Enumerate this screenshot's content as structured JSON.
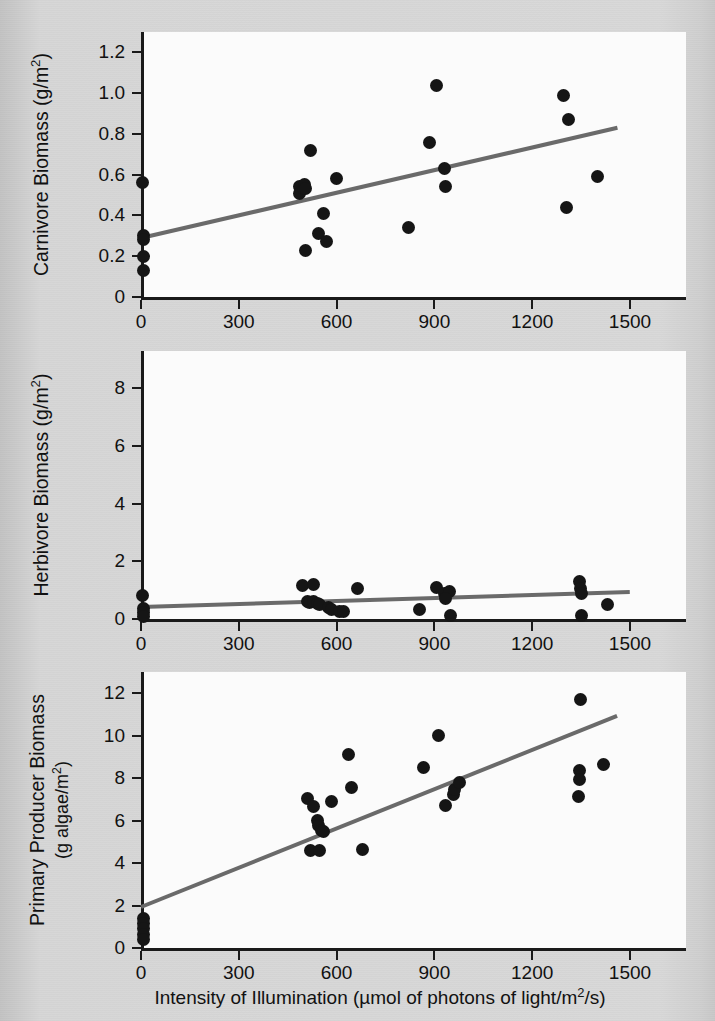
{
  "figure": {
    "x_axis_title": "Intensity of Illumination (µmol of photons of light/m²/s)",
    "x_ticks": [
      "0",
      "300",
      "600",
      "900",
      "1200",
      "1500"
    ],
    "dot_color": "#151515",
    "fit_line_color": "#6a6a6a",
    "panel_color": "#fbfbfb",
    "page_color": "#d6d6d6"
  },
  "ghost_text": [
    {
      "text": "DNA",
      "x": 404,
      "y": 84,
      "size": 23
    },
    {
      "text": "replication",
      "x": 372,
      "y": 112,
      "size": 23
    },
    {
      "text": "enzymes",
      "x": 378,
      "y": 140,
      "size": 23
    },
    {
      "text": "&",
      "x": 428,
      "y": 166,
      "size": 21
    },
    {
      "text": "proteins",
      "x": 380,
      "y": 192,
      "size": 23
    },
    {
      "text": "Key",
      "x": 216,
      "y": 430,
      "size": 17
    },
    {
      "text": "Sea Otters",
      "x": 172,
      "y": 462,
      "size": 17
    },
    {
      "text": "Sea Urchins",
      "x": 276,
      "y": 462,
      "size": 17
    },
    {
      "text": "Kelp",
      "x": 186,
      "y": 686,
      "size": 19
    },
    {
      "text": "A in the case of a kelp forest ecosystem,",
      "x": 170,
      "y": 712,
      "size": 17
    },
    {
      "text": "decreasing kelp biomass leads to reduced",
      "x": 170,
      "y": 740,
      "size": 17
    },
    {
      "text": "populations of sea urchins and a subsequent",
      "x": 170,
      "y": 768,
      "size": 17
    },
    {
      "text": "decrease in otters, a switch from the pyramid",
      "x": 170,
      "y": 796,
      "size": 17
    },
    {
      "text": "of biomass represented on the left.",
      "x": 170,
      "y": 824,
      "size": 17
    },
    {
      "text": "There are spaces, the population densities and",
      "x": 150,
      "y": 896,
      "size": 17
    },
    {
      "text": "the trophic levels cannot be sustained and survival",
      "x": 150,
      "y": 924,
      "size": 17
    }
  ],
  "chart_data": [
    {
      "type": "scatter",
      "id": "carnivore",
      "title": "",
      "xlabel": "Intensity of Illumination (µmol of photons of light/m²/s)",
      "ylabel": "Carnivore Biomass (g/m²)",
      "xlim": [
        0,
        1500
      ],
      "ylim": [
        0,
        1.3
      ],
      "xticks": [
        0,
        300,
        600,
        900,
        1200,
        1500
      ],
      "yticks": [
        0,
        0.2,
        0.4,
        0.6,
        0.8,
        1.0,
        1.2
      ],
      "ytick_labels": [
        "0",
        "0.2",
        "0.4",
        "0.6",
        "0.8",
        "1.0",
        "1.2"
      ],
      "grid": false,
      "legend": null,
      "points": [
        {
          "x": 5,
          "y": 0.56
        },
        {
          "x": 8,
          "y": 0.3
        },
        {
          "x": 8,
          "y": 0.28
        },
        {
          "x": 8,
          "y": 0.2
        },
        {
          "x": 8,
          "y": 0.13
        },
        {
          "x": 487,
          "y": 0.54
        },
        {
          "x": 487,
          "y": 0.51
        },
        {
          "x": 497,
          "y": 0.53
        },
        {
          "x": 500,
          "y": 0.55
        },
        {
          "x": 505,
          "y": 0.53
        },
        {
          "x": 505,
          "y": 0.23
        },
        {
          "x": 520,
          "y": 0.72
        },
        {
          "x": 545,
          "y": 0.31
        },
        {
          "x": 560,
          "y": 0.41
        },
        {
          "x": 570,
          "y": 0.27
        },
        {
          "x": 600,
          "y": 0.58
        },
        {
          "x": 820,
          "y": 0.34
        },
        {
          "x": 885,
          "y": 0.76
        },
        {
          "x": 905,
          "y": 1.04
        },
        {
          "x": 930,
          "y": 0.63
        },
        {
          "x": 935,
          "y": 0.54
        },
        {
          "x": 1295,
          "y": 0.99
        },
        {
          "x": 1310,
          "y": 0.87
        },
        {
          "x": 1305,
          "y": 0.44
        },
        {
          "x": 1400,
          "y": 0.59
        }
      ],
      "fit_line": {
        "x0": 0,
        "y0": 0.29,
        "x1": 1460,
        "y1": 0.83
      }
    },
    {
      "type": "scatter",
      "id": "herbivore",
      "title": "",
      "xlabel": "Intensity of Illumination (µmol of photons of light/m²/s)",
      "ylabel": "Herbivore Biomass (g/m²)",
      "xlim": [
        0,
        1500
      ],
      "ylim": [
        0,
        9.3
      ],
      "xticks": [
        0,
        300,
        600,
        900,
        1200,
        1500
      ],
      "yticks": [
        0,
        2,
        4,
        6,
        8
      ],
      "ytick_labels": [
        "0",
        "2",
        "4",
        "6",
        "8"
      ],
      "grid": false,
      "legend": null,
      "points": [
        {
          "x": 5,
          "y": 0.8
        },
        {
          "x": 8,
          "y": 0.35
        },
        {
          "x": 8,
          "y": 0.22
        },
        {
          "x": 8,
          "y": 0.1
        },
        {
          "x": 495,
          "y": 1.15
        },
        {
          "x": 530,
          "y": 1.2
        },
        {
          "x": 510,
          "y": 0.62
        },
        {
          "x": 518,
          "y": 0.58
        },
        {
          "x": 528,
          "y": 0.6
        },
        {
          "x": 540,
          "y": 0.55
        },
        {
          "x": 548,
          "y": 0.52
        },
        {
          "x": 575,
          "y": 0.4
        },
        {
          "x": 585,
          "y": 0.32
        },
        {
          "x": 610,
          "y": 0.27
        },
        {
          "x": 620,
          "y": 0.25
        },
        {
          "x": 665,
          "y": 1.05
        },
        {
          "x": 855,
          "y": 0.33
        },
        {
          "x": 905,
          "y": 1.08
        },
        {
          "x": 930,
          "y": 0.88
        },
        {
          "x": 945,
          "y": 0.95
        },
        {
          "x": 935,
          "y": 0.7
        },
        {
          "x": 950,
          "y": 0.13
        },
        {
          "x": 1345,
          "y": 1.3
        },
        {
          "x": 1348,
          "y": 1.05
        },
        {
          "x": 1350,
          "y": 0.88
        },
        {
          "x": 1350,
          "y": 0.12
        },
        {
          "x": 1430,
          "y": 0.52
        }
      ],
      "fit_line": {
        "x0": 0,
        "y0": 0.4,
        "x1": 1500,
        "y1": 0.92
      }
    },
    {
      "type": "scatter",
      "id": "primary-producer",
      "title": "",
      "xlabel": "Intensity of Illumination (µmol of photons of light/m²/s)",
      "ylabel": "Primary Producer Biomass (g algae/m²)",
      "xlim": [
        0,
        1500
      ],
      "ylim": [
        0,
        13
      ],
      "xticks": [
        0,
        300,
        600,
        900,
        1200,
        1500
      ],
      "yticks": [
        0,
        2,
        4,
        6,
        8,
        10,
        12
      ],
      "ytick_labels": [
        "0",
        "2",
        "4",
        "6",
        "8",
        "10",
        "12"
      ],
      "grid": false,
      "legend": null,
      "points": [
        {
          "x": 8,
          "y": 1.4
        },
        {
          "x": 8,
          "y": 1.15
        },
        {
          "x": 8,
          "y": 0.9
        },
        {
          "x": 8,
          "y": 0.62
        },
        {
          "x": 8,
          "y": 0.42
        },
        {
          "x": 510,
          "y": 7.05
        },
        {
          "x": 520,
          "y": 4.6
        },
        {
          "x": 530,
          "y": 6.65
        },
        {
          "x": 540,
          "y": 6.0
        },
        {
          "x": 543,
          "y": 5.75
        },
        {
          "x": 548,
          "y": 4.6
        },
        {
          "x": 555,
          "y": 5.55
        },
        {
          "x": 560,
          "y": 5.5
        },
        {
          "x": 585,
          "y": 6.9
        },
        {
          "x": 635,
          "y": 9.1
        },
        {
          "x": 645,
          "y": 7.55
        },
        {
          "x": 678,
          "y": 4.62
        },
        {
          "x": 868,
          "y": 8.5
        },
        {
          "x": 912,
          "y": 10.0
        },
        {
          "x": 935,
          "y": 6.7
        },
        {
          "x": 958,
          "y": 7.25
        },
        {
          "x": 962,
          "y": 7.45
        },
        {
          "x": 978,
          "y": 7.8
        },
        {
          "x": 1348,
          "y": 11.7
        },
        {
          "x": 1345,
          "y": 8.35
        },
        {
          "x": 1345,
          "y": 7.95
        },
        {
          "x": 1342,
          "y": 7.15
        },
        {
          "x": 1420,
          "y": 8.65
        }
      ],
      "fit_line": {
        "x0": 0,
        "y0": 1.95,
        "x1": 1460,
        "y1": 10.95
      }
    }
  ],
  "axis_titles": {
    "carnivore": "Carnivore Biomass (g/m²)",
    "herbivore": "Herbivore Biomass (g/m²)",
    "primary_line1": "Primary Producer Biomass",
    "primary_line2": "(g algae/m²)"
  }
}
